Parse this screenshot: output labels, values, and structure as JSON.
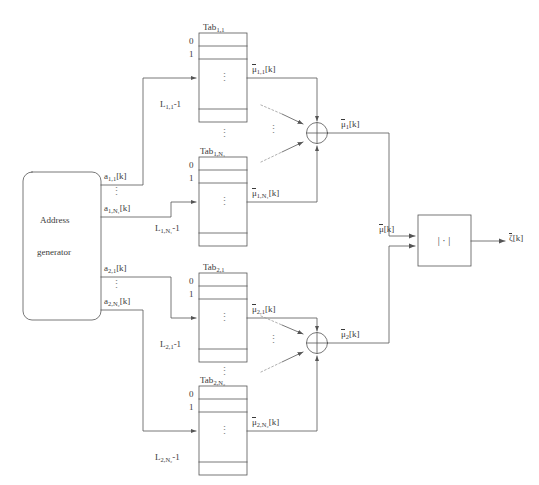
{
  "diagram": {
    "colors": {
      "line": "#555555",
      "text": "#3a3a3a",
      "background": "#ffffff",
      "dotted": "#9a9a9a"
    },
    "address_generator": {
      "line1": "Address",
      "line2": "generator"
    },
    "magnitude_block": {
      "symbol": "| · |"
    },
    "tables": [
      {
        "id": "tab-1-1",
        "caption_base": "Tab",
        "caption_sub": "1,1",
        "row_first": "0",
        "row_second": "1",
        "row_last_base": "L",
        "row_last_sub": "1,1",
        "row_last_suffix": "-1",
        "dots": "⋮",
        "input_label_base": "a",
        "input_label_sub": "1,1",
        "input_label_suffix": "[k]",
        "output_label_base": "μ",
        "output_label_sub": "1,1",
        "output_label_suffix": "[k]"
      },
      {
        "id": "tab-1-N1",
        "caption_base": "Tab",
        "caption_sub": "1,N₁",
        "row_first": "0",
        "row_second": "1",
        "row_last_base": "L",
        "row_last_sub": "1,N₁",
        "row_last_suffix": "-1",
        "dots": "⋮",
        "input_label_base": "a",
        "input_label_sub": "1,N₁",
        "input_label_suffix": "[k]",
        "output_label_base": "μ",
        "output_label_sub": "1,N₁",
        "output_label_suffix": "[k]"
      },
      {
        "id": "tab-2-1",
        "caption_base": "Tab",
        "caption_sub": "2,1",
        "row_first": "0",
        "row_second": "1",
        "row_last_base": "L",
        "row_last_sub": "2,1",
        "row_last_suffix": "-1",
        "dots": "⋮",
        "input_label_base": "a",
        "input_label_sub": "2,1",
        "input_label_suffix": "[k]",
        "output_label_base": "μ",
        "output_label_sub": "2,1",
        "output_label_suffix": "[k]"
      },
      {
        "id": "tab-2-N2",
        "caption_base": "Tab",
        "caption_sub": "2,N₂",
        "row_first": "0",
        "row_second": "1",
        "row_last_base": "L",
        "row_last_sub": "2,N₂",
        "row_last_suffix": "-1",
        "dots": "⋮",
        "input_label_base": "a",
        "input_label_sub": "2,N₂",
        "input_label_suffix": "[k]",
        "output_label_base": "μ",
        "output_label_sub": "2,N₂",
        "output_label_suffix": "[k]"
      }
    ],
    "adders": [
      {
        "id": "adder-1",
        "glyph": "+",
        "output_base": "μ",
        "output_sub": "1",
        "output_suffix": "[k]"
      },
      {
        "id": "adder-2",
        "glyph": "+",
        "output_base": "μ",
        "output_sub": "2",
        "output_suffix": "[k]"
      }
    ],
    "signals": {
      "mu_combined_base": "μ",
      "mu_combined_suffix": "[k]",
      "output_base": "ζ",
      "output_suffix": "[k]"
    },
    "ellipsis_vertical": "⋮"
  }
}
